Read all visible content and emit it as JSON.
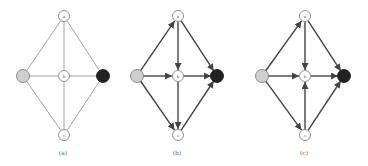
{
  "colors": {
    "edge_thin": "#8a8a8a",
    "edge_thick": "#444444",
    "node_fill": "#ffffff",
    "node_stroke": "#777777",
    "source_fill": "#cfcfcf",
    "sink_fill": "#222222"
  },
  "panels": [
    {
      "id": "a",
      "caption": "(a)",
      "directed": false,
      "nodes": {
        "a": {
          "x": 64,
          "y": 16,
          "label": "a"
        },
        "s": {
          "x": 23,
          "y": 76,
          "label": ""
        },
        "b": {
          "x": 64,
          "y": 76,
          "label": "b"
        },
        "t": {
          "x": 103,
          "y": 76,
          "label": ""
        },
        "c": {
          "x": 64,
          "y": 135,
          "label": "c"
        }
      },
      "edges": [
        [
          "s",
          "a"
        ],
        [
          "s",
          "b"
        ],
        [
          "s",
          "c"
        ],
        [
          "a",
          "b"
        ],
        [
          "b",
          "c"
        ],
        [
          "a",
          "t"
        ],
        [
          "b",
          "t"
        ],
        [
          "c",
          "t"
        ]
      ],
      "caption_pos": {
        "x": 63,
        "y": 155
      }
    },
    {
      "id": "b",
      "caption": "(b)",
      "directed": true,
      "nodes": {
        "a": {
          "x": 178,
          "y": 16,
          "label": "a"
        },
        "s": {
          "x": 137,
          "y": 76,
          "label": ""
        },
        "b": {
          "x": 178,
          "y": 76,
          "label": "b"
        },
        "t": {
          "x": 217,
          "y": 76,
          "label": ""
        },
        "c": {
          "x": 178,
          "y": 135,
          "label": "c"
        }
      },
      "edges": [
        [
          "s",
          "a"
        ],
        [
          "s",
          "b"
        ],
        [
          "s",
          "c"
        ],
        [
          "a",
          "b"
        ],
        [
          "b",
          "c"
        ],
        [
          "a",
          "t"
        ],
        [
          "b",
          "t"
        ],
        [
          "c",
          "t"
        ]
      ],
      "caption_pos": {
        "x": 177,
        "y": 155
      }
    },
    {
      "id": "c",
      "caption": "(c)",
      "directed": true,
      "nodes": {
        "a": {
          "x": 305,
          "y": 16,
          "label": "a"
        },
        "s": {
          "x": 262,
          "y": 76,
          "label": ""
        },
        "b": {
          "x": 305,
          "y": 76,
          "label": "b"
        },
        "t": {
          "x": 344,
          "y": 76,
          "label": ""
        },
        "c": {
          "x": 305,
          "y": 135,
          "label": "c"
        }
      },
      "edges": [
        [
          "s",
          "a"
        ],
        [
          "s",
          "b"
        ],
        [
          "s",
          "c"
        ],
        [
          "a",
          "b"
        ],
        [
          "c",
          "b"
        ],
        [
          "a",
          "t"
        ],
        [
          "b",
          "t"
        ],
        [
          "c",
          "t"
        ]
      ],
      "caption_pos": {
        "x": 304,
        "y": 155
      }
    }
  ]
}
